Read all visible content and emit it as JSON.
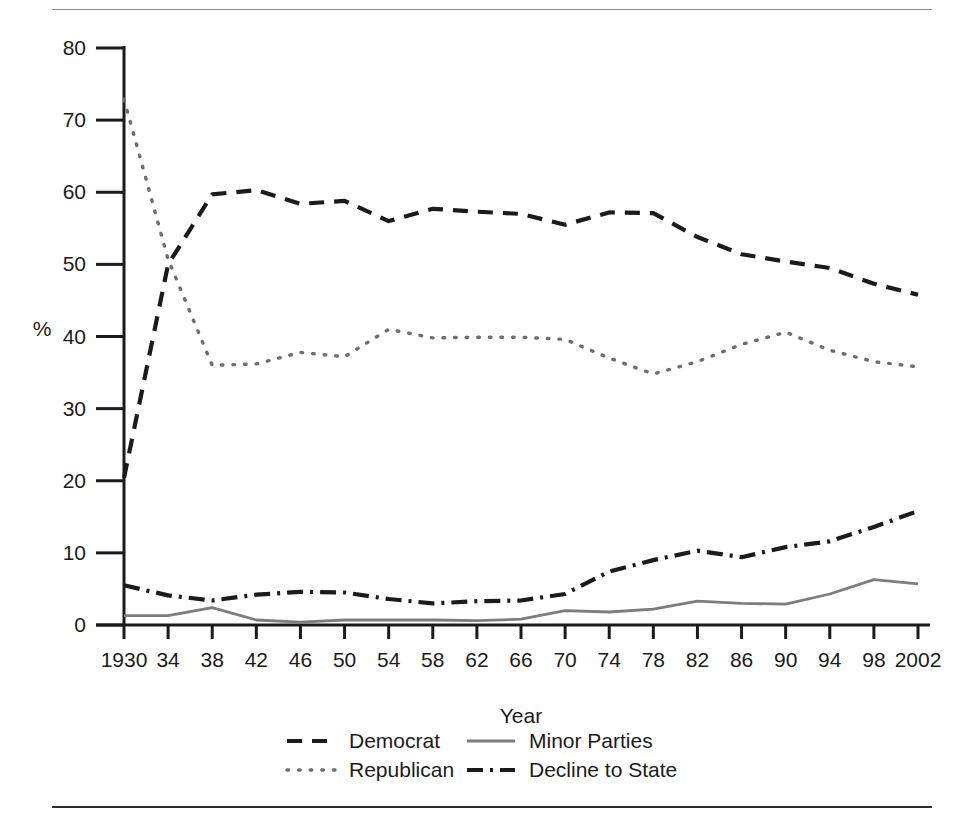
{
  "figure": {
    "top_rule": "",
    "bottom_rule": ""
  },
  "chart_data": {
    "type": "line",
    "title": "",
    "xlabel": "Year",
    "ylabel": "%",
    "xlim": [
      1930,
      2002
    ],
    "ylim": [
      0,
      80
    ],
    "grid": false,
    "legend_position": "bottom",
    "x": [
      1930,
      1934,
      1938,
      1942,
      1946,
      1950,
      1954,
      1958,
      1962,
      1966,
      1970,
      1974,
      1978,
      1982,
      1986,
      1990,
      1994,
      1998,
      2002
    ],
    "xtick_labels": [
      "1930",
      "34",
      "38",
      "42",
      "46",
      "50",
      "54",
      "58",
      "62",
      "66",
      "70",
      "74",
      "78",
      "82",
      "86",
      "90",
      "94",
      "98",
      "2002"
    ],
    "ytick_labels": [
      "0",
      "10",
      "20",
      "30",
      "40",
      "50",
      "60",
      "70",
      "80"
    ],
    "ytick_values": [
      0,
      10,
      20,
      30,
      40,
      50,
      60,
      70,
      80
    ],
    "series": [
      {
        "name": "Democrat",
        "style": "dashed",
        "color": "#1b1b1b",
        "values": [
          20.4,
          50.0,
          59.7,
          60.3,
          58.4,
          58.8,
          56.0,
          57.7,
          57.3,
          57.0,
          55.5,
          57.2,
          57.1,
          53.8,
          51.4,
          50.4,
          49.5,
          47.3,
          45.8
        ]
      },
      {
        "name": "Republican",
        "style": "dotted",
        "color": "#6e6e6e",
        "values": [
          72.9,
          50.7,
          36.0,
          36.2,
          37.8,
          37.2,
          41.0,
          39.8,
          39.9,
          39.9,
          39.6,
          37.0,
          34.8,
          36.5,
          38.9,
          40.6,
          38.1,
          36.5,
          35.8
        ]
      },
      {
        "name": "Minor Parties",
        "style": "solid",
        "color": "#7d7d7d",
        "values": [
          1.3,
          1.3,
          2.4,
          0.7,
          0.4,
          0.7,
          0.7,
          0.7,
          0.6,
          0.8,
          2.0,
          1.8,
          2.2,
          3.3,
          3.0,
          2.9,
          4.3,
          6.3,
          5.7
        ]
      },
      {
        "name": "Decline to State",
        "style": "dashdot",
        "color": "#1b1b1b",
        "values": [
          5.5,
          4.1,
          3.4,
          4.2,
          4.6,
          4.5,
          3.6,
          3.0,
          3.3,
          3.4,
          4.3,
          7.4,
          9.0,
          10.3,
          9.4,
          10.8,
          11.6,
          13.6,
          15.8
        ]
      }
    ]
  },
  "legend": {
    "items": [
      {
        "label": "Democrat",
        "swatch": "dashed-line-swatch"
      },
      {
        "label": "Republican",
        "swatch": "dotted-line-swatch"
      },
      {
        "label": "Minor Parties",
        "swatch": "solid-line-swatch"
      },
      {
        "label": "Decline to State",
        "swatch": "dashdot-line-swatch"
      }
    ]
  }
}
